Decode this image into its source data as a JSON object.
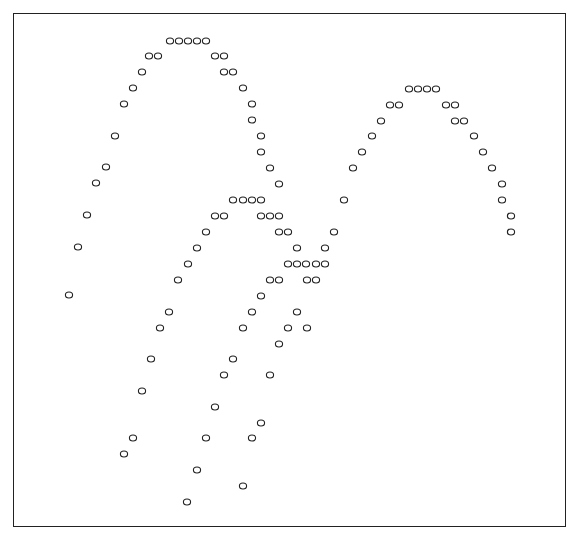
{
  "chart_data": {
    "type": "scatter",
    "title": "",
    "xlabel": "",
    "ylabel": "",
    "grid": false,
    "legend": null,
    "marker": "o",
    "marker_color": "#222222",
    "frame": {
      "x": 13,
      "y": 13,
      "width": 553,
      "height": 514
    },
    "note": "Character-plot style scatter; coordinates are pixel positions of each 'o' marker (x right, y down).",
    "points": [
      [
        170,
        41
      ],
      [
        179,
        41
      ],
      [
        188,
        41
      ],
      [
        197,
        41
      ],
      [
        206,
        41
      ],
      [
        149,
        56
      ],
      [
        158,
        56
      ],
      [
        215,
        56
      ],
      [
        224,
        56
      ],
      [
        142,
        72
      ],
      [
        224,
        72
      ],
      [
        233,
        72
      ],
      [
        133,
        88
      ],
      [
        243,
        88
      ],
      [
        124,
        104
      ],
      [
        252,
        104
      ],
      [
        252,
        120
      ],
      [
        115,
        136
      ],
      [
        261,
        136
      ],
      [
        261,
        152
      ],
      [
        106,
        167
      ],
      [
        270,
        168
      ],
      [
        96,
        183
      ],
      [
        279,
        184
      ],
      [
        87,
        215
      ],
      [
        78,
        247
      ],
      [
        69,
        295
      ],
      [
        233,
        200
      ],
      [
        243,
        200
      ],
      [
        252,
        200
      ],
      [
        261,
        200
      ],
      [
        215,
        216
      ],
      [
        224,
        216
      ],
      [
        261,
        216
      ],
      [
        270,
        216
      ],
      [
        279,
        216
      ],
      [
        206,
        232
      ],
      [
        279,
        232
      ],
      [
        288,
        232
      ],
      [
        197,
        248
      ],
      [
        297,
        248
      ],
      [
        188,
        264
      ],
      [
        288,
        264
      ],
      [
        297,
        264
      ],
      [
        306,
        264
      ],
      [
        316,
        264
      ],
      [
        325,
        264
      ],
      [
        178,
        280
      ],
      [
        270,
        280
      ],
      [
        279,
        280
      ],
      [
        307,
        280
      ],
      [
        316,
        280
      ],
      [
        261,
        296
      ],
      [
        169,
        312
      ],
      [
        252,
        312
      ],
      [
        297,
        312
      ],
      [
        160,
        328
      ],
      [
        243,
        328
      ],
      [
        288,
        328
      ],
      [
        307,
        328
      ],
      [
        279,
        344
      ],
      [
        151,
        359
      ],
      [
        233,
        359
      ],
      [
        224,
        375
      ],
      [
        270,
        375
      ],
      [
        142,
        391
      ],
      [
        215,
        407
      ],
      [
        261,
        423
      ],
      [
        133,
        438
      ],
      [
        206,
        438
      ],
      [
        252,
        438
      ],
      [
        124,
        454
      ],
      [
        197,
        470
      ],
      [
        243,
        486
      ],
      [
        187,
        502
      ],
      [
        409,
        89
      ],
      [
        418,
        89
      ],
      [
        427,
        89
      ],
      [
        436,
        89
      ],
      [
        390,
        105
      ],
      [
        399,
        105
      ],
      [
        446,
        105
      ],
      [
        455,
        105
      ],
      [
        381,
        121
      ],
      [
        455,
        121
      ],
      [
        464,
        121
      ],
      [
        372,
        136
      ],
      [
        474,
        136
      ],
      [
        362,
        152
      ],
      [
        483,
        152
      ],
      [
        353,
        168
      ],
      [
        492,
        168
      ],
      [
        502,
        184
      ],
      [
        344,
        200
      ],
      [
        502,
        200
      ],
      [
        511,
        216
      ],
      [
        334,
        232
      ],
      [
        511,
        232
      ],
      [
        325,
        248
      ]
    ]
  }
}
